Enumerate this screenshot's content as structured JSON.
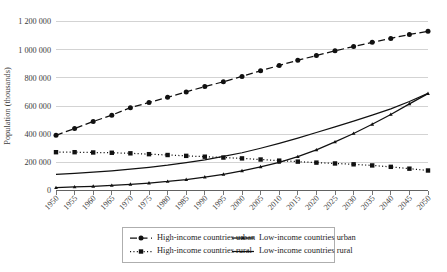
{
  "chart_data": {
    "type": "line",
    "title": "",
    "xlabel": "",
    "ylabel": "Population (thousands)",
    "xlim": [
      1950,
      2050
    ],
    "ylim": [
      0,
      1200000
    ],
    "ytick_step": 200000,
    "grid": true,
    "legend_position": "bottom",
    "x": [
      1950,
      1955,
      1960,
      1965,
      1970,
      1975,
      1980,
      1985,
      1990,
      1995,
      2000,
      2005,
      2010,
      2015,
      2020,
      2025,
      2030,
      2035,
      2040,
      2045,
      2050
    ],
    "xticklabels": [
      "1950",
      "1955",
      "1960",
      "1965",
      "1970",
      "1975",
      "1980",
      "1985",
      "1990",
      "1995",
      "2000",
      "2005",
      "2010",
      "2015",
      "2020",
      "2025",
      "2030",
      "2035",
      "2040",
      "2045",
      "2050"
    ],
    "yticklabels": [
      "0",
      "200 000",
      "400 000",
      "600 000",
      "800 000",
      "1 000 000",
      "1 200 000"
    ],
    "ytickvalues": [
      0,
      200000,
      400000,
      600000,
      800000,
      1000000,
      1200000
    ],
    "series": [
      {
        "name": "High-income countries urban",
        "style": "dashed",
        "marker": "circle",
        "color": "#111111",
        "values": [
          392000,
          440000,
          490000,
          535000,
          588000,
          625000,
          662000,
          700000,
          738000,
          772000,
          810000,
          850000,
          888000,
          925000,
          958000,
          992000,
          1022000,
          1052000,
          1080000,
          1108000,
          1130000
        ]
      },
      {
        "name": "High-income countries rural",
        "style": "dotted",
        "marker": "square",
        "color": "#111111",
        "values": [
          272000,
          272000,
          270000,
          268000,
          264000,
          258000,
          252000,
          246000,
          240000,
          234000,
          228000,
          220000,
          212000,
          205000,
          198000,
          192000,
          186000,
          178000,
          168000,
          155000,
          142000
        ]
      },
      {
        "name": "Low-income countries urban",
        "style": "solid-marker",
        "marker": "triangle",
        "color": "#111111",
        "values": [
          20000,
          25000,
          30000,
          36000,
          44000,
          53000,
          64000,
          78000,
          95000,
          115000,
          140000,
          168000,
          200000,
          240000,
          288000,
          345000,
          405000,
          470000,
          540000,
          615000,
          688000
        ]
      },
      {
        "name": "Low-income countries rural",
        "style": "solid",
        "marker": "none",
        "color": "#111111",
        "values": [
          115000,
          122000,
          130000,
          140000,
          152000,
          165000,
          180000,
          198000,
          218000,
          242000,
          268000,
          300000,
          335000,
          372000,
          412000,
          452000,
          492000,
          535000,
          580000,
          632000,
          690000
        ]
      }
    ]
  },
  "legend": {
    "entries": [
      {
        "label": "High-income countries urban",
        "style": "dashed",
        "marker": "circle"
      },
      {
        "label": "High-income countries rural",
        "style": "dotted",
        "marker": "square"
      },
      {
        "label": "Low-income countries urban",
        "style": "solid-marker",
        "marker": "triangle"
      },
      {
        "label": "Low-income countries rural",
        "style": "solid",
        "marker": "none"
      }
    ]
  },
  "colors": {
    "grid": "#c8c8c8",
    "axis": "#555555",
    "ink": "#111111",
    "background": "#ffffff"
  }
}
